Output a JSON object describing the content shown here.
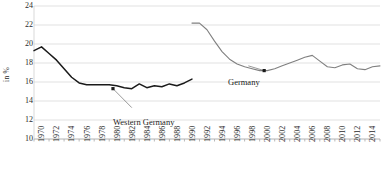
{
  "chart_data": {
    "type": "line",
    "title": "",
    "subtitle": "",
    "xlabel": "",
    "ylabel": "in %",
    "ylim": [
      10,
      24
    ],
    "ytick_values": [
      24,
      22,
      20,
      18,
      16,
      14,
      12,
      10
    ],
    "ytick_labels": [
      "24",
      "22",
      "20",
      "18",
      "16",
      "14",
      "12",
      "10"
    ],
    "xlim": [
      1970,
      2016
    ],
    "xtick_labels": [
      "1970",
      "1972",
      "1974",
      "1976",
      "1978",
      "1980",
      "1982",
      "1984",
      "1986",
      "1988",
      "1990",
      "1992",
      "1994",
      "1996",
      "1998",
      "2000",
      "2002",
      "2004",
      "2006",
      "2008",
      "2010",
      "2012",
      "2014",
      "2016"
    ],
    "grid": "horizontal",
    "legend_position": "inline-annotations",
    "series": [
      {
        "name": "Western Germany",
        "color": "#1a1a1a",
        "label_x": 1987,
        "label_y": 13.0,
        "x": [
          1970,
          1971,
          1972,
          1973,
          1974,
          1975,
          1976,
          1977,
          1978,
          1979,
          1980,
          1981,
          1982,
          1983,
          1984,
          1985,
          1986,
          1987,
          1988,
          1989,
          1990,
          1991
        ],
        "values": [
          19.3,
          19.7,
          19.0,
          18.3,
          17.4,
          16.5,
          15.9,
          15.7,
          15.7,
          15.7,
          15.7,
          15.6,
          15.4,
          15.3,
          15.8,
          15.4,
          15.6,
          15.5,
          15.8,
          15.6,
          15.9,
          16.3
        ]
      },
      {
        "name": "Germany",
        "color": "#808080",
        "label_x": 2000,
        "label_y": 17.0,
        "x": [
          1991,
          1992,
          1993,
          1994,
          1995,
          1996,
          1997,
          1998,
          1999,
          2000,
          2001,
          2002,
          2003,
          2004,
          2005,
          2006,
          2007,
          2008,
          2009,
          2010,
          2011,
          2012,
          2013,
          2014,
          2015,
          2016
        ],
        "values": [
          22.2,
          22.2,
          21.5,
          20.3,
          19.2,
          18.4,
          17.9,
          17.6,
          17.4,
          17.2,
          17.2,
          17.4,
          17.7,
          18.0,
          18.3,
          18.6,
          18.8,
          18.2,
          17.6,
          17.5,
          17.8,
          17.9,
          17.4,
          17.3,
          17.6,
          17.7
        ]
      }
    ],
    "annotations": [
      {
        "name": "western-germany-leader",
        "from_x": 1983,
        "from_y": 13.3,
        "to_x": 1980.5,
        "to_y": 15.3
      },
      {
        "name": "germany-leader",
        "from_x": 1998.5,
        "from_y": 17.7,
        "to_x": 2000.6,
        "to_y": 17.2
      }
    ]
  },
  "axis": {
    "y_title": "in %"
  }
}
